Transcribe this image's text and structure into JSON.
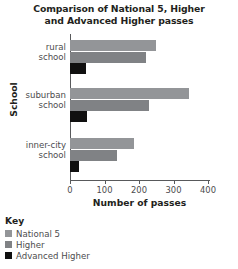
{
  "chart_data": {
    "type": "bar",
    "orientation": "horizontal",
    "title": "Comparison of National 5, Higher and Advanced Higher passes",
    "title_line1": "Comparison of National 5, Higher",
    "title_line2": "and Advanced Higher passes",
    "xlabel": "Number of passes",
    "ylabel": "School",
    "categories": [
      "rural school",
      "suburban school",
      "inner-city school"
    ],
    "category_lines": [
      [
        "rural",
        "school"
      ],
      [
        "suburban",
        "school"
      ],
      [
        "inner-city",
        "school"
      ]
    ],
    "series": [
      {
        "name": "National 5",
        "color": "#939598",
        "values": [
          250,
          345,
          185
        ]
      },
      {
        "name": "Higher",
        "color": "#808285",
        "values": [
          220,
          230,
          135
        ]
      },
      {
        "name": "Advanced Higher",
        "color": "#101010",
        "values": [
          45,
          50,
          25
        ]
      }
    ],
    "xlim": [
      0,
      400
    ],
    "xticks": [
      0,
      100,
      200,
      300,
      400
    ],
    "xtick_labels": [
      "0",
      "100",
      "200",
      "300",
      "400"
    ],
    "grid": false,
    "legend_position": "below-left"
  },
  "legend": {
    "title": "Key",
    "entries": [
      "National 5",
      "Higher",
      "Advanced Higher"
    ]
  }
}
